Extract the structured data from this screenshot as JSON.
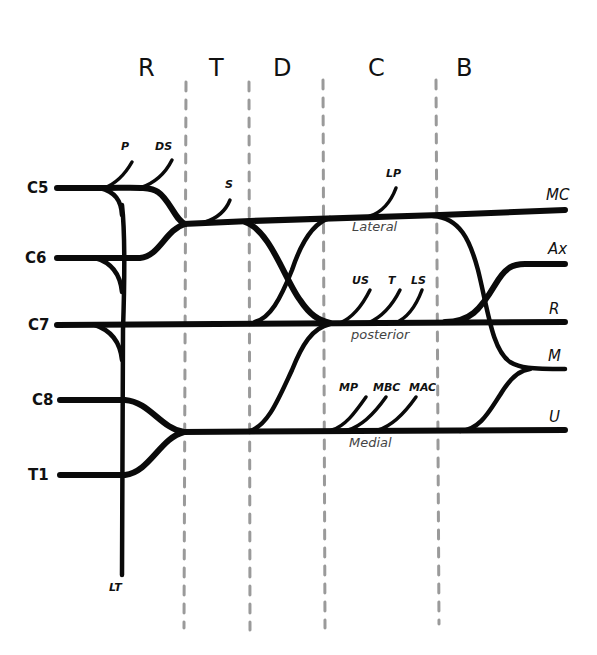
{
  "diagram": {
    "sections": [
      {
        "id": "roots",
        "label": "R"
      },
      {
        "id": "trunks",
        "label": "T"
      },
      {
        "id": "divisions",
        "label": "D"
      },
      {
        "id": "cords",
        "label": "C"
      },
      {
        "id": "branches",
        "label": "B"
      }
    ],
    "roots": [
      {
        "id": "c5",
        "label": "C5"
      },
      {
        "id": "c6",
        "label": "C6"
      },
      {
        "id": "c7",
        "label": "C7"
      },
      {
        "id": "c8",
        "label": "C8"
      },
      {
        "id": "t1",
        "label": "T1"
      }
    ],
    "root_branches": [
      {
        "id": "phrenic",
        "label": "P"
      },
      {
        "id": "dorsal-scapular",
        "label": "DS"
      },
      {
        "id": "long-thoracic",
        "label": "LT"
      }
    ],
    "trunk_branches": [
      {
        "id": "suprascapular",
        "label": "S"
      }
    ],
    "cords": [
      {
        "id": "lateral",
        "label": "Lateral",
        "branches": [
          {
            "id": "lateral-pectoral",
            "label": "LP"
          }
        ]
      },
      {
        "id": "posterior",
        "label": "posterior",
        "branches": [
          {
            "id": "upper-subscapular",
            "label": "US"
          },
          {
            "id": "thoracodorsal",
            "label": "T"
          },
          {
            "id": "lower-subscapular",
            "label": "LS"
          }
        ]
      },
      {
        "id": "medial",
        "label": "Medial",
        "branches": [
          {
            "id": "medial-pectoral",
            "label": "MP"
          },
          {
            "id": "medial-brachial-cutaneous",
            "label": "MBC"
          },
          {
            "id": "medial-antebrachial-cutaneous",
            "label": "MAC"
          }
        ]
      }
    ],
    "terminal_branches": [
      {
        "id": "musculocutaneous",
        "label": "MC"
      },
      {
        "id": "axillary",
        "label": "Ax"
      },
      {
        "id": "radial",
        "label": "R"
      },
      {
        "id": "median",
        "label": "M"
      },
      {
        "id": "ulnar",
        "label": "U"
      }
    ],
    "colors": {
      "nerve": "#0a0a0a",
      "divider": "#9a9a9a",
      "cord_label": "#444444",
      "background": "#ffffff"
    }
  }
}
